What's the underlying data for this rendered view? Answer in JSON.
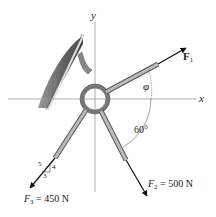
{
  "diagram": {
    "type": "statics force diagram",
    "axes": {
      "x_label": "x",
      "y_label": "y"
    },
    "forces": [
      {
        "name": "F1",
        "label": "F",
        "subscript": "1",
        "magnitude_text": "",
        "direction": "up-right, angle phi from x-axis"
      },
      {
        "name": "F2",
        "label": "F",
        "subscript": "2",
        "magnitude_text": "= 500 N",
        "direction": "down-right, 60° from x-axis"
      },
      {
        "name": "F3",
        "label": "F",
        "subscript": "3",
        "magnitude_text": "= 450 N",
        "direction": "down-left, slope 3-4-5"
      }
    ],
    "angles": {
      "phi": "φ",
      "f2_angle": "60°"
    },
    "slope_triangle": {
      "hypotenuse": "5",
      "vertical": "4",
      "horizontal": "3"
    },
    "colors": {
      "wall": "#6e6e6e",
      "axis": "#999999",
      "arrow": "#111111",
      "ring": "#777777"
    }
  }
}
